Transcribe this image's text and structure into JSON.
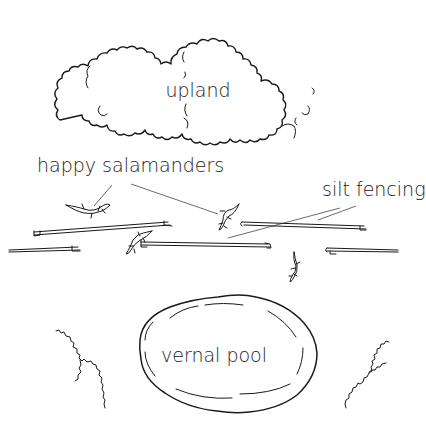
{
  "diagram": {
    "style": "hand-drawn line illustration",
    "colors": {
      "ink": "#1a1a1a",
      "background": "#ffffff"
    },
    "regions": {
      "upland": {
        "label": "upland",
        "shape": "tree-canopy cloud"
      },
      "vernal_pool": {
        "label": "vernal pool",
        "shape": "oval pond"
      }
    },
    "callouts": {
      "salamanders": {
        "label": "happy salamanders",
        "points_to": 2
      },
      "silt_fencing": {
        "label": "silt fencing",
        "points_to": 2
      }
    },
    "counts": {
      "fence_segments": 5,
      "salamanders": 4,
      "shrubs": 2
    }
  }
}
